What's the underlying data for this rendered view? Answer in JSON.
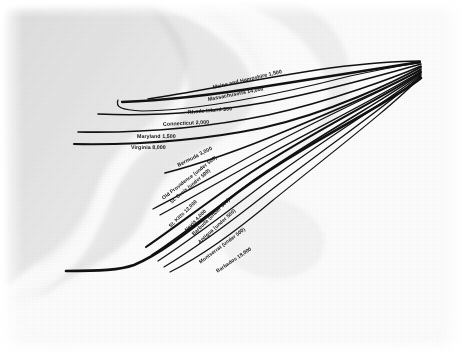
{
  "figure": {
    "type": "flow-map",
    "medium": "aged paper scan",
    "background_description": "faint ghosted coastline map",
    "ink_color": "#111111",
    "paper_color": "#fdfdfd",
    "convergence_point": "upper-right"
  },
  "chart_data": {
    "type": "line",
    "title": "",
    "xlabel": "",
    "ylabel": "",
    "legend_position": "inline-labels",
    "grid": false,
    "categories": [
      "Maine and Hampshire",
      "Massachusetts",
      "Rhode Island",
      "Connecticut",
      "Maryland",
      "Virginia",
      "Bermuda",
      "Old Providence",
      "St. Croix",
      "St. Kitts",
      "Nevis",
      "Barbuda",
      "Antigua",
      "Montserrat",
      "Barbados"
    ],
    "values": [
      1500,
      14000,
      300,
      2000,
      1500,
      8000,
      3000,
      500,
      500,
      12000,
      4000,
      500,
      500,
      500,
      18000
    ],
    "value_labels": [
      "1,500",
      "14,000",
      "300",
      "2,000",
      "1,500",
      "8,000",
      "3,000",
      "(under 500)",
      "(under 500)",
      "12,000",
      "4,000",
      "(under 500)",
      "(under 500)",
      "(under 500)",
      "18,000"
    ]
  },
  "labels": [
    {
      "id": "maine-and-hampshire",
      "text": "Maine and Hampshire 1,500",
      "x": 213,
      "y": 88,
      "rotate": -13,
      "size": 5.3
    },
    {
      "id": "massachusetts",
      "text": "Massachusetts 14,000",
      "x": 208,
      "y": 100,
      "rotate": -11,
      "size": 5.3
    },
    {
      "id": "rhode-island",
      "text": "Rhode Island 300",
      "x": 188,
      "y": 113,
      "rotate": -5,
      "size": 5.3
    },
    {
      "id": "connecticut",
      "text": "Connecticut 2,000",
      "x": 163,
      "y": 125,
      "rotate": -3,
      "size": 5.3
    },
    {
      "id": "maryland",
      "text": "Maryland 1,500",
      "x": 137,
      "y": 137,
      "rotate": 0,
      "size": 5.3
    },
    {
      "id": "virginia",
      "text": "Virginia 8,000",
      "x": 131,
      "y": 148,
      "rotate": 0,
      "size": 5.3
    },
    {
      "id": "bermuda",
      "text": "Bermuda 3,000",
      "x": 178,
      "y": 166,
      "rotate": -27,
      "size": 5.3
    },
    {
      "id": "old-providence",
      "text": "Old Providence (under 500)",
      "x": 163,
      "y": 199,
      "rotate": -38,
      "size": 5.1
    },
    {
      "id": "st-croix",
      "text": "St. Croix (under 500)",
      "x": 171,
      "y": 203,
      "rotate": -40,
      "size": 5.1
    },
    {
      "id": "st-kitts",
      "text": "St. Kitts 12,000",
      "x": 170,
      "y": 227,
      "rotate": -44,
      "size": 5.1
    },
    {
      "id": "nevis",
      "text": "Nevis 4,000",
      "x": 186,
      "y": 231,
      "rotate": -46,
      "size": 5.1
    },
    {
      "id": "barbuda",
      "text": "Barbuda (under 500)",
      "x": 193,
      "y": 235,
      "rotate": -44,
      "size": 5.1
    },
    {
      "id": "antigua",
      "text": "Antigua (under 500)",
      "x": 199,
      "y": 243,
      "rotate": -42,
      "size": 5.1
    },
    {
      "id": "montserrat",
      "text": "Montserrat (under 500)",
      "x": 200,
      "y": 263,
      "rotate": -37,
      "size": 5.1
    },
    {
      "id": "barbados",
      "text": "Barbados 18,000",
      "x": 217,
      "y": 272,
      "rotate": -34,
      "size": 5.1
    }
  ],
  "flows": [
    {
      "id": "flow-maine-and-hampshire",
      "path": "M 148,99 C 196,92 260,78 330,68 C 370,63 402,61 420,61",
      "width": 1.5
    },
    {
      "id": "flow-massachusetts",
      "path": "M 122,102 C 150,101 200,97 268,86 C 330,76 392,66 420,62",
      "width": 2.3
    },
    {
      "id": "flow-rhode-island",
      "path": "M 118,100 C 115,107 121,110 142,111 C 196,111 280,94 350,76 C 388,68 410,64 420,63",
      "width": 1.2
    },
    {
      "id": "flow-connecticut",
      "path": "M 98,114 C 140,116 200,114 268,102 C 330,90 396,71 421,64",
      "width": 1.6
    },
    {
      "id": "flow-maryland",
      "path": "M 78,132 C 130,133 200,129 268,115 C 332,101 398,76 421,66",
      "width": 1.6
    },
    {
      "id": "flow-virginia",
      "path": "M 74,144 C 130,145 198,141 262,128 C 330,113 398,80 421,67",
      "width": 2.0
    },
    {
      "id": "flow-bermuda",
      "path": "M 165,173 C 200,164 240,150 288,130 C 346,106 400,82 421,69",
      "width": 1.7
    },
    {
      "id": "flow-old-providence",
      "path": "M 153,209 C 184,193 214,176 258,152 C 322,117 398,84 421,70",
      "width": 1.3
    },
    {
      "id": "flow-st-croix",
      "path": "M 160,215 C 190,199 222,180 266,156 C 328,122 398,87 421,71",
      "width": 1.3
    },
    {
      "id": "flow-st-kitts",
      "path": "M 146,247 C 178,225 210,200 250,173 C 318,128 398,90 421,72",
      "width": 2.1
    },
    {
      "id": "flow-nevis",
      "path": "M 152,255 C 186,232 216,208 254,180 C 320,134 398,92 421,73",
      "width": 1.6
    },
    {
      "id": "flow-barbuda",
      "path": "M 158,261 C 190,240 222,216 260,187 C 322,140 398,95 421,74",
      "width": 1.2
    },
    {
      "id": "flow-antigua",
      "path": "M 164,267 C 196,248 228,224 266,194 C 326,147 398,98 421,75",
      "width": 1.2
    },
    {
      "id": "flow-montserrat",
      "path": "M 170,272 C 202,256 234,233 272,201 C 330,154 399,101 421,76",
      "width": 1.2
    },
    {
      "id": "flow-barbados",
      "path": "M 66,271 C 100,271 120,270 134,265 C 158,255 186,234 224,203 C 290,150 390,104 421,78",
      "width": 2.6
    }
  ]
}
